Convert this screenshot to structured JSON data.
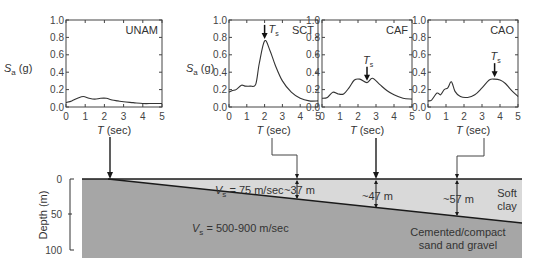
{
  "figure": {
    "y_axis_label": "S",
    "y_axis_label_sub": "a",
    "y_axis_label_unit": " (g)",
    "x_axis_label": "T",
    "x_axis_label_unit": " (sec)",
    "ts_label": "T",
    "ts_label_sub": "s",
    "y_ticks": [
      "0.0",
      "0.2",
      "0.4",
      "0.6",
      "0.8",
      "1.0"
    ],
    "x_ticks": [
      "0",
      "1",
      "2",
      "3",
      "4",
      "5"
    ]
  },
  "chart_data": [
    {
      "type": "line",
      "title": "UNAM",
      "xlabel": "T (sec)",
      "ylabel": "Sa (g)",
      "xlim": [
        0,
        5
      ],
      "ylim": [
        0,
        1.0
      ],
      "x": [
        0,
        0.3,
        0.6,
        0.9,
        1.2,
        1.5,
        1.8,
        2.1,
        2.4,
        2.7,
        3.0,
        3.5,
        4.0,
        4.5,
        5.0
      ],
      "values": [
        0.05,
        0.07,
        0.1,
        0.12,
        0.1,
        0.09,
        0.1,
        0.1,
        0.08,
        0.07,
        0.06,
        0.05,
        0.04,
        0.04,
        0.04
      ],
      "ts": null
    },
    {
      "type": "line",
      "title": "SCT",
      "xlabel": "T (sec)",
      "ylabel": "Sa (g)",
      "xlim": [
        0,
        5
      ],
      "ylim": [
        0,
        1.0
      ],
      "x": [
        0,
        0.2,
        0.4,
        0.7,
        0.9,
        1.2,
        1.5,
        1.7,
        2.0,
        2.3,
        2.6,
        3.0,
        3.5,
        4.0,
        4.5,
        5.0
      ],
      "values": [
        0.17,
        0.19,
        0.2,
        0.25,
        0.24,
        0.24,
        0.26,
        0.5,
        0.76,
        0.65,
        0.48,
        0.3,
        0.17,
        0.1,
        0.07,
        0.07
      ],
      "ts": 2.0
    },
    {
      "type": "line",
      "title": "CAF",
      "xlabel": "T (sec)",
      "ylabel": "",
      "xlim": [
        0,
        5
      ],
      "ylim": [
        0,
        1.0
      ],
      "x": [
        0,
        0.3,
        0.6,
        0.9,
        1.2,
        1.5,
        1.8,
        2.1,
        2.5,
        2.8,
        3.2,
        3.6,
        4.0,
        4.5,
        5.0
      ],
      "values": [
        0.1,
        0.11,
        0.17,
        0.15,
        0.15,
        0.22,
        0.31,
        0.32,
        0.28,
        0.33,
        0.26,
        0.19,
        0.14,
        0.1,
        0.09
      ],
      "ts": 2.5
    },
    {
      "type": "line",
      "title": "CAO",
      "xlabel": "T (sec)",
      "ylabel": "",
      "xlim": [
        0,
        5
      ],
      "ylim": [
        0,
        1.0
      ],
      "x": [
        0,
        0.2,
        0.5,
        0.7,
        0.9,
        1.1,
        1.3,
        1.5,
        1.8,
        2.2,
        2.6,
        3.0,
        3.4,
        3.7,
        4.0,
        4.3,
        4.6,
        5.0
      ],
      "values": [
        0.07,
        0.08,
        0.16,
        0.14,
        0.2,
        0.22,
        0.29,
        0.18,
        0.12,
        0.11,
        0.14,
        0.22,
        0.31,
        0.32,
        0.31,
        0.27,
        0.2,
        0.12
      ],
      "ts": 3.7
    }
  ],
  "profile": {
    "depth_label": "Depth (m)",
    "depth_ticks": [
      "0",
      "50",
      "100"
    ],
    "soft_clay_vs": "V",
    "soft_clay_vs_sub": "s",
    "soft_clay_vs_value": " = 75 m/sec",
    "base_vs": "V",
    "base_vs_sub": "s",
    "base_vs_value": " = 500-900 m/sec",
    "soft_clay_label_1": "Soft",
    "soft_clay_label_2": "clay",
    "base_label_1": "Cemented/compact",
    "base_label_2": "sand and gravel",
    "thickness_labels": [
      "~37 m",
      "~47 m",
      "~57 m"
    ],
    "colors": {
      "soft_clay": "#d9d9d9",
      "base": "#a6a6a6",
      "line": "#1a1a1a"
    }
  }
}
